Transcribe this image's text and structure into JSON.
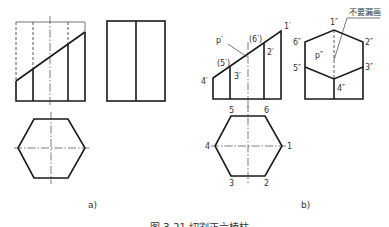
{
  "figure": {
    "caption": "图 3-21  切割正六棱柱",
    "subfigures": [
      {
        "id": "a",
        "label": "a)",
        "views": [
          "front-view",
          "side-view",
          "top-view"
        ]
      },
      {
        "id": "b",
        "label": "b)",
        "views": [
          "front-view",
          "side-view",
          "top-view"
        ],
        "front_view_labels": {
          "p": "p′",
          "v1": "1′",
          "v2": "2′",
          "v3": "3′",
          "v4": "4′",
          "v5": "(5′)",
          "v6": "(6′)"
        },
        "side_view_labels": {
          "p": "p″",
          "v1": "1″",
          "v2": "2″",
          "v3": "3″",
          "v4": "4″",
          "v5": "5″",
          "v6": "6″"
        },
        "top_view_labels": {
          "v1": "1",
          "v2": "2",
          "v3": "3",
          "v4": "4",
          "v5": "5",
          "v6": "6"
        },
        "annotation": "不要漏画"
      }
    ]
  }
}
